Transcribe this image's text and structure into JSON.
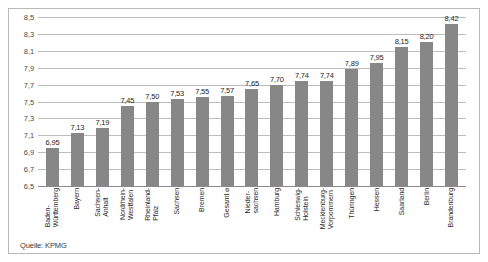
{
  "figure": {
    "source_note": "Quelle: KPMG",
    "bar_color": "#878787",
    "grid_color": "#bdbdbd",
    "frame_color": "#b9b9b9"
  },
  "chart_data": {
    "type": "bar",
    "title": "",
    "subtitle": "",
    "xlabel": "",
    "ylabel": "",
    "ylim": [
      6.5,
      8.5
    ],
    "yticks": [
      "8,5",
      "8,3",
      "8,1",
      "7,9",
      "7,7",
      "7,5",
      "7,3",
      "7,1",
      "6,9",
      "6,7",
      "6,5"
    ],
    "ytick_values": [
      8.5,
      8.3,
      8.1,
      7.9,
      7.7,
      7.5,
      7.3,
      7.1,
      6.9,
      6.7,
      6.5
    ],
    "grid": true,
    "legend": "none",
    "categories": [
      "Baden-Württemberg",
      "Bayern",
      "Sachsen-Anhalt",
      "Nordrhein-Westfalen",
      "Rheinland-Pfalz",
      "Sachsen",
      "Bremen",
      "Gesamt ⌀",
      "Niedersachsen",
      "Hamburg",
      "Schleswig-Holstein",
      "Mecklenburg-Vorpommern",
      "Thüringen",
      "Hessen",
      "Saarland",
      "Berlin",
      "Brandenburg"
    ],
    "category_lines": [
      [
        "Baden-",
        "Württemberg"
      ],
      [
        "Bayern"
      ],
      [
        "Sachsen-",
        "Anhalt"
      ],
      [
        "Nordrhein-",
        "Westfalen"
      ],
      [
        "Rheinland-",
        "Pfalz"
      ],
      [
        "Sachsen"
      ],
      [
        "Bremen"
      ],
      [
        "Gesamt ⌀"
      ],
      [
        "Nieder-",
        "sachsen"
      ],
      [
        "Hamburg"
      ],
      [
        "Schleswig-",
        "Holstein"
      ],
      [
        "Mecklenburg-",
        "Vorpommern"
      ],
      [
        "Thüringen"
      ],
      [
        "Hessen"
      ],
      [
        "Saarland"
      ],
      [
        "Berlin"
      ],
      [
        "Brandenburg"
      ]
    ],
    "values": [
      6.95,
      7.13,
      7.19,
      7.45,
      7.5,
      7.53,
      7.55,
      7.57,
      7.65,
      7.7,
      7.74,
      7.74,
      7.89,
      7.95,
      8.15,
      8.2,
      8.42
    ],
    "value_labels": [
      "6,95",
      "7,13",
      "7,19",
      "7,45",
      "7,50",
      "7,53",
      "7,55",
      "7,57",
      "7,65",
      "7,70",
      "7,74",
      "7,74",
      "7,89",
      "7,95",
      "8,15",
      "8,20",
      "8,42"
    ]
  }
}
